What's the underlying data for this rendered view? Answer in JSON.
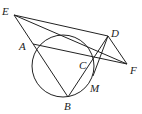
{
  "diagram": {
    "type": "geometry",
    "points": [
      {
        "name": "E",
        "label": "E"
      },
      {
        "name": "A",
        "label": "A"
      },
      {
        "name": "D",
        "label": "D"
      },
      {
        "name": "C",
        "label": "C"
      },
      {
        "name": "F",
        "label": "F"
      },
      {
        "name": "B",
        "label": "B"
      },
      {
        "name": "M",
        "label": "M"
      }
    ],
    "segments": [
      "E-D",
      "E-F",
      "E-B",
      "A-F",
      "D-F",
      "D-B",
      "D-M"
    ],
    "circle": {
      "passes_through": [
        "A",
        "B",
        "C",
        "M"
      ]
    }
  }
}
